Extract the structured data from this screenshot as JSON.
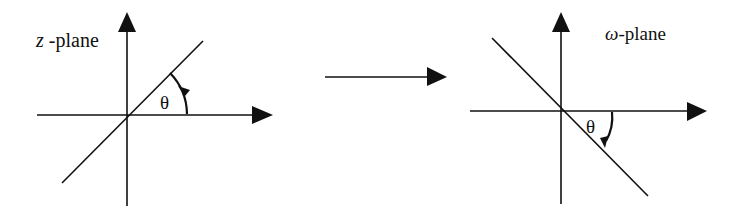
{
  "diagram": {
    "left_panel": {
      "title_var": "z",
      "title_suffix": " -plane",
      "angle_label": "θ",
      "angle_direction": "counter-clockwise"
    },
    "mapping_arrow": {
      "direction": "right"
    },
    "right_panel": {
      "title_var": "ω",
      "title_suffix": "-plane",
      "angle_label": "θ",
      "angle_direction": "clockwise"
    },
    "colors": {
      "stroke": "#111111",
      "background": "#ffffff"
    }
  }
}
